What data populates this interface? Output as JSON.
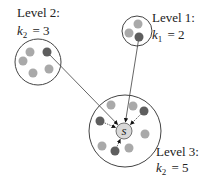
{
  "colors": {
    "light_node": "#a9a9a9",
    "dark_node": "#5e5e5e",
    "ring": "#444444",
    "edge": "#555555",
    "center_fill": "#d9d9d9"
  },
  "center_node": {
    "label": "s",
    "cx": 124,
    "cy": 131,
    "r": 8
  },
  "groups": [
    {
      "id": "level-2",
      "label_line1": "Level 2:",
      "label_k": "k",
      "label_sub": "2",
      "label_value": "= 3",
      "label_x": 17,
      "label_y1": 17,
      "label_y2": 35,
      "cx": 38,
      "cy": 62,
      "r": 23,
      "nodes": [
        {
          "cx": 30,
          "cy": 52,
          "type": "light"
        },
        {
          "cx": 47,
          "cy": 52,
          "type": "dark"
        },
        {
          "cx": 23,
          "cy": 61,
          "type": "light"
        },
        {
          "cx": 33,
          "cy": 73,
          "type": "light"
        },
        {
          "cx": 49,
          "cy": 69,
          "type": "light"
        }
      ],
      "link_from": {
        "x": 47,
        "y": 52
      }
    },
    {
      "id": "level-1",
      "label_line1": "Level 1:",
      "label_k": "k",
      "label_sub": "1",
      "label_value": "= 2",
      "label_x": 152,
      "label_y1": 22,
      "label_y2": 39,
      "cx": 137,
      "cy": 31,
      "r": 15,
      "nodes": [
        {
          "cx": 138,
          "cy": 24,
          "type": "light"
        },
        {
          "cx": 129,
          "cy": 33,
          "type": "light"
        },
        {
          "cx": 139,
          "cy": 37,
          "type": "dark"
        }
      ],
      "link_from": {
        "x": 139,
        "y": 37
      }
    },
    {
      "id": "level-3",
      "label_line1": "Level 3:",
      "label_k": "k",
      "label_sub": "2",
      "label_value": "= 5",
      "label_x": 156,
      "label_y1": 156,
      "label_y2": 172,
      "cx": 125,
      "cy": 131,
      "r": 36,
      "nodes": [
        {
          "cx": 111,
          "cy": 105,
          "type": "light"
        },
        {
          "cx": 133,
          "cy": 106,
          "type": "light"
        },
        {
          "cx": 144,
          "cy": 111,
          "type": "dark"
        },
        {
          "cx": 100,
          "cy": 121,
          "type": "dark"
        },
        {
          "cx": 145,
          "cy": 134,
          "type": "light"
        },
        {
          "cx": 102,
          "cy": 146,
          "type": "light"
        },
        {
          "cx": 115,
          "cy": 151,
          "type": "dark"
        },
        {
          "cx": 129,
          "cy": 148,
          "type": "light"
        }
      ],
      "internal_arrows_from": [
        {
          "x": 144,
          "y": 111
        },
        {
          "x": 100,
          "y": 121
        },
        {
          "x": 115,
          "y": 151
        }
      ]
    }
  ]
}
